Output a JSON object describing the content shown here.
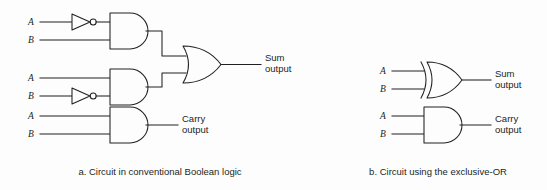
{
  "figure": {
    "background_color": "#fdfdfd",
    "line_color": "#231f20"
  },
  "panels": [
    {
      "id": "panel-a",
      "caption": "a. Circuit in conventional  Boolean logic",
      "gates": [
        {
          "id": "not-a-top",
          "type": "NOT",
          "label": "inverter"
        },
        {
          "id": "and-top",
          "type": "AND",
          "inputs": [
            "A",
            "B"
          ]
        },
        {
          "id": "not-b-middle",
          "type": "NOT",
          "label": "inverter"
        },
        {
          "id": "and-middle",
          "type": "AND",
          "inputs": [
            "A",
            "B"
          ]
        },
        {
          "id": "or-sum",
          "type": "OR",
          "output": "Sum output"
        },
        {
          "id": "and-carry",
          "type": "AND",
          "inputs": [
            "A",
            "B"
          ],
          "output": "Carry output"
        }
      ],
      "inputs": [
        {
          "id": "a1",
          "label": "A"
        },
        {
          "id": "b1",
          "label": "B"
        },
        {
          "id": "a2",
          "label": "A"
        },
        {
          "id": "b2",
          "label": "B"
        },
        {
          "id": "a3",
          "label": "A"
        },
        {
          "id": "b3",
          "label": "B"
        }
      ],
      "outputs": [
        {
          "id": "sum",
          "line1": "Sum",
          "line2": "output"
        },
        {
          "id": "carry",
          "line1": "Carry",
          "line2": "output"
        }
      ]
    },
    {
      "id": "panel-b",
      "caption": "b. Circuit using the  exclusive-OR",
      "gates": [
        {
          "id": "xor-sum",
          "type": "XOR",
          "inputs": [
            "A",
            "B"
          ],
          "output": "Sum output"
        },
        {
          "id": "and-carry-b",
          "type": "AND",
          "inputs": [
            "A",
            "B"
          ],
          "output": "Carry output"
        }
      ],
      "inputs": [
        {
          "id": "a4",
          "label": "A"
        },
        {
          "id": "b4",
          "label": "B"
        },
        {
          "id": "a5",
          "label": "A"
        },
        {
          "id": "b5",
          "label": "B"
        }
      ],
      "outputs": [
        {
          "id": "sum-b",
          "line1": "Sum",
          "line2": "output"
        },
        {
          "id": "carry-b",
          "line1": "Carry",
          "line2": "output"
        }
      ]
    }
  ]
}
